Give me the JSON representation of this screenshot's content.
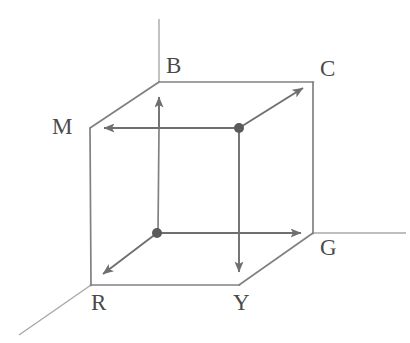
{
  "figure": {
    "name": "rgb-color-cube-diagram",
    "background_color": "#ffffff",
    "line_color": "#7d7d7d",
    "axis_color": "#a6a6a6",
    "label_color": "#4a4a4a",
    "width": 410,
    "height": 343
  },
  "labels": {
    "blue": "B",
    "cyan": "C",
    "magenta": "M",
    "green": "G",
    "red": "R",
    "yellow": "Y"
  },
  "label_positions": {
    "blue": {
      "x": 166,
      "y": 73
    },
    "cyan": {
      "x": 320,
      "y": 76
    },
    "magenta": {
      "x": 52,
      "y": 133
    },
    "green": {
      "x": 320,
      "y": 254
    },
    "red": {
      "x": 90,
      "y": 309
    },
    "yellow": {
      "x": 233,
      "y": 309
    }
  },
  "vertices": {
    "origin_black_point": {
      "x": 157,
      "y": 233,
      "label": "white-point-origin"
    },
    "white_point": {
      "x": 239,
      "y": 128,
      "label": "black-point-far-corner"
    },
    "blue_corner": {
      "x": 159,
      "y": 82
    },
    "cyan_corner": {
      "x": 313,
      "y": 82
    },
    "magenta_corner": {
      "x": 90,
      "y": 128
    },
    "green_corner": {
      "x": 313,
      "y": 233
    },
    "red_corner": {
      "x": 91,
      "y": 285
    },
    "yellow_corner": {
      "x": 239,
      "y": 285
    },
    "front_bottom_left_hidden": {
      "x": 157,
      "y": 233
    }
  },
  "axes": [
    {
      "name": "blue-axis",
      "from": {
        "x": 159,
        "y": 19
      },
      "to": {
        "x": 159,
        "y": 82
      }
    },
    {
      "name": "green-axis",
      "from": {
        "x": 313,
        "y": 233
      },
      "to": {
        "x": 405,
        "y": 233
      }
    },
    {
      "name": "red-axis",
      "from": {
        "x": 91,
        "y": 285
      },
      "to": {
        "x": 20,
        "y": 334
      }
    }
  ],
  "arrows": [
    {
      "name": "blue-arrow",
      "from": {
        "x": 159,
        "y": 128
      },
      "to": {
        "x": 159,
        "y": 90
      }
    },
    {
      "name": "cyan-arrow",
      "from": {
        "x": 239,
        "y": 128
      },
      "to": {
        "x": 308,
        "y": 85
      }
    },
    {
      "name": "magenta-arrow",
      "from": {
        "x": 239,
        "y": 128
      },
      "to": {
        "x": 95,
        "y": 128
      }
    },
    {
      "name": "green-arrow",
      "from": {
        "x": 157,
        "y": 233
      },
      "to": {
        "x": 308,
        "y": 233
      }
    },
    {
      "name": "red-arrow",
      "from": {
        "x": 157,
        "y": 233
      },
      "to": {
        "x": 95,
        "y": 281
      }
    },
    {
      "name": "yellow-arrow",
      "from": {
        "x": 239,
        "y": 128
      },
      "to": {
        "x": 239,
        "y": 281
      }
    }
  ],
  "cube_edges": [
    {
      "name": "edge-magenta-to-blue",
      "from": {
        "x": 90,
        "y": 128
      },
      "to": {
        "x": 159,
        "y": 82
      }
    },
    {
      "name": "edge-blue-to-cyan",
      "from": {
        "x": 159,
        "y": 82
      },
      "to": {
        "x": 313,
        "y": 82
      }
    },
    {
      "name": "edge-cyan-to-green",
      "from": {
        "x": 313,
        "y": 82
      },
      "to": {
        "x": 313,
        "y": 233
      }
    },
    {
      "name": "edge-magenta-to-red",
      "from": {
        "x": 90,
        "y": 128
      },
      "to": {
        "x": 91,
        "y": 285
      }
    },
    {
      "name": "edge-red-to-yellow",
      "from": {
        "x": 91,
        "y": 285
      },
      "to": {
        "x": 239,
        "y": 285
      }
    },
    {
      "name": "edge-yellow-to-green",
      "from": {
        "x": 239,
        "y": 285
      },
      "to": {
        "x": 313,
        "y": 233
      }
    },
    {
      "name": "edge-white-to-cyan",
      "from": {
        "x": 239,
        "y": 128
      },
      "to": {
        "x": 313,
        "y": 82
      }
    },
    {
      "name": "edge-white-to-magenta",
      "from": {
        "x": 239,
        "y": 128
      },
      "to": {
        "x": 90,
        "y": 128
      }
    },
    {
      "name": "edge-white-to-yellow",
      "from": {
        "x": 239,
        "y": 128
      },
      "to": {
        "x": 239,
        "y": 285
      }
    },
    {
      "name": "edge-origin-to-blue",
      "from": {
        "x": 157,
        "y": 233
      },
      "to": {
        "x": 159,
        "y": 128
      }
    },
    {
      "name": "edge-origin-to-green",
      "from": {
        "x": 157,
        "y": 233
      },
      "to": {
        "x": 313,
        "y": 233
      }
    },
    {
      "name": "edge-origin-to-red",
      "from": {
        "x": 157,
        "y": 233
      },
      "to": {
        "x": 91,
        "y": 285
      }
    }
  ]
}
